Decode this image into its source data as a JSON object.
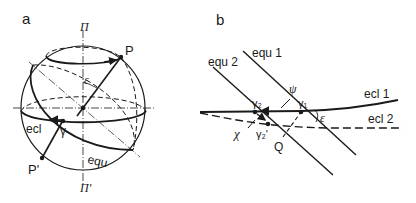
{
  "panel_a": {
    "label": "a",
    "pole_top": "Π",
    "pole_bottom": "Π'",
    "point_P": "P",
    "point_P_prime": "P'",
    "angle_epsilon": "ε",
    "ecliptic": "ecl",
    "vernal_point": "γ",
    "equator": "equ"
  },
  "panel_b": {
    "label": "b",
    "equator_1": "equ 1",
    "equator_2": "equ 2",
    "ecliptic_1": "ecl 1",
    "ecliptic_2": "ecl 2",
    "angle_psi": "ψ",
    "angle_chi": "χ",
    "angle_epsilon": "ε",
    "vernal_1": "γ₁",
    "vernal_2": "γ₂",
    "vernal_2_prime": "γ₂'",
    "point_Q": "Q"
  },
  "colors": {
    "ink": "#1a1a1a",
    "background": "#ffffff"
  }
}
